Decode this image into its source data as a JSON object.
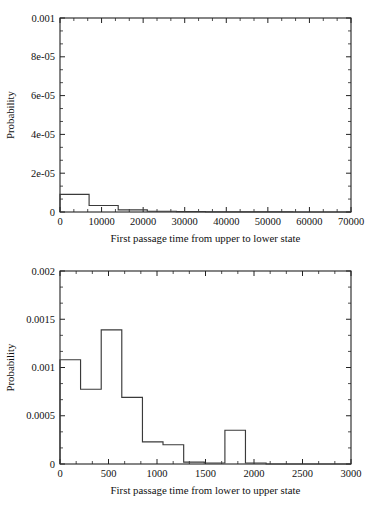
{
  "figure": {
    "background": "#ffffff",
    "line_color": "#3a3a3a",
    "axis_color": "#222222"
  },
  "chart_data": [
    {
      "type": "bar",
      "id": "upper-to-lower",
      "title": "",
      "xlabel": "First passage time from upper to lower state",
      "ylabel": "Probability",
      "xlim": [
        0,
        70000
      ],
      "ylim": [
        0,
        0.001
      ],
      "grid": false,
      "legend": "none",
      "xticks": [
        0,
        10000,
        20000,
        30000,
        40000,
        50000,
        60000,
        70000
      ],
      "xticklabels": [
        "0",
        "10000",
        "20000",
        "30000",
        "40000",
        "50000",
        "60000",
        "70000"
      ],
      "yticks": [
        0,
        2e-05,
        4e-05,
        6e-05,
        8e-05,
        0.001
      ],
      "yticklabels": [
        "0",
        "2e-05",
        "4e-05",
        "6e-05",
        "8e-05",
        "0.001"
      ],
      "x_minor_ticks_per_interval": 2,
      "y_minor_ticks_per_interval": 2,
      "bin_edges": [
        0,
        7000,
        14000,
        21000,
        28000,
        35000,
        42000,
        49000,
        56000,
        63000,
        70000
      ],
      "values": [
        9.1e-05,
        3.33e-05,
        1.13e-05,
        3.7e-06,
        1.9e-06,
        1e-06,
        4e-07,
        3e-07,
        2e-07,
        1e-07
      ]
    },
    {
      "type": "bar",
      "id": "lower-to-upper",
      "title": "",
      "xlabel": "First passage time from lower to upper state",
      "ylabel": "Probability",
      "xlim": [
        0,
        3000
      ],
      "ylim": [
        0,
        0.002
      ],
      "grid": false,
      "legend": "none",
      "xticks": [
        0,
        500,
        1000,
        1500,
        2000,
        2500,
        3000
      ],
      "xticklabels": [
        "0",
        "500",
        "1000",
        "1500",
        "2000",
        "2500",
        "3000"
      ],
      "yticks": [
        0,
        0.0005,
        0.001,
        0.0015,
        0.002
      ],
      "yticklabels": [
        "0",
        "0.0005",
        "0.001",
        "0.0015",
        "0.002"
      ],
      "x_minor_ticks_per_interval": 2,
      "y_minor_ticks_per_interval": 2,
      "bin_edges": [
        0,
        212,
        425,
        637,
        850,
        1062,
        1275,
        1487,
        1700,
        1912,
        2125
      ],
      "values": [
        0.00108,
        0.000775,
        0.00139,
        0.00069,
        0.00023,
        0.0002,
        2e-05,
        1e-05,
        0.00035,
        1e-05
      ]
    }
  ]
}
